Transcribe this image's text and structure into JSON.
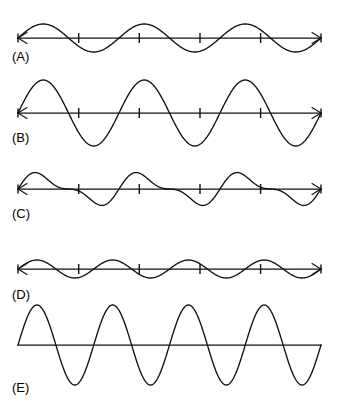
{
  "figure": {
    "title": "",
    "background_color": "#ffffff",
    "stroke_color": "#111111",
    "width": 337,
    "height": 414
  },
  "labels": [
    {
      "id": "A",
      "text": "(A)",
      "x": 12,
      "y": 50
    },
    {
      "id": "B",
      "text": "(B)",
      "x": 12,
      "y": 131
    },
    {
      "id": "C",
      "text": "(C)",
      "x": 12,
      "y": 207
    },
    {
      "id": "D",
      "text": "(D)",
      "x": 12,
      "y": 288
    },
    {
      "id": "E",
      "text": "(E)",
      "x": 12,
      "y": 381
    }
  ],
  "chart_data": {
    "type": "line",
    "xlabel": "",
    "ylabel": "",
    "grid": false,
    "legend_position": "none",
    "axis_x_start": 18,
    "axis_x_end": 321,
    "shared_tick_positions": [
      78.7,
      139.3,
      200.0,
      260.6
    ],
    "panels": [
      {
        "id": "A",
        "label": "(A)",
        "axis_y": 38,
        "x_start": 18,
        "x_end": 321,
        "amplitude_px": 14,
        "cycles": 3,
        "phase": "sine-positive-first",
        "has_arrows": true,
        "has_ticks": true,
        "tick_count": 4,
        "waveform": "sine",
        "series": [
          {
            "name": "A",
            "description": "3 full sine cycles, small amplitude",
            "amplitude": 14,
            "wavelength_px": 101,
            "values_note": "y = axis_y - 14*sin(2*pi*3*(x-18)/303)"
          }
        ]
      },
      {
        "id": "B",
        "label": "(B)",
        "axis_y": 113,
        "x_start": 18,
        "x_end": 321,
        "amplitude_px": 33,
        "cycles": 3,
        "phase": "sine-positive-first",
        "has_arrows": true,
        "has_ticks": true,
        "tick_count": 4,
        "waveform": "sine",
        "series": [
          {
            "name": "B",
            "description": "3 full sine cycles, large amplitude",
            "amplitude": 33,
            "wavelength_px": 101,
            "values_note": "y = axis_y - 33*sin(2*pi*3*(x-18)/303)"
          }
        ]
      },
      {
        "id": "C",
        "label": "(C)",
        "axis_y": 189,
        "x_start": 18,
        "x_end": 321,
        "amplitude_px": 17,
        "cycles": 3,
        "phase": "beat-superposition",
        "has_arrows": true,
        "has_ticks": true,
        "tick_count": 4,
        "waveform": "superposition",
        "series": [
          {
            "name": "C",
            "description": "Superposition of 3-cycle and 6-cycle sine waves producing a beat-like waveform",
            "amplitude": 17,
            "components": [
              {
                "cycles": 3,
                "amplitude": 13
              },
              {
                "cycles": 6,
                "amplitude": 6
              }
            ],
            "values_note": "y = axis_y - (13*sin(2*pi*3*t) + 6*sin(2*pi*6*t)), t=(x-18)/303"
          }
        ]
      },
      {
        "id": "D",
        "label": "(D)",
        "axis_y": 269,
        "x_start": 18,
        "x_end": 321,
        "amplitude_px": 9,
        "cycles": 4,
        "phase": "sine-positive-first",
        "has_arrows": true,
        "has_ticks": true,
        "tick_count": 4,
        "waveform": "sine",
        "series": [
          {
            "name": "D",
            "description": "4 full sine cycles, very small amplitude",
            "amplitude": 9,
            "wavelength_px": 76,
            "values_note": "y = axis_y - 9*sin(2*pi*4*(x-18)/303)"
          }
        ]
      },
      {
        "id": "E",
        "label": "(E)",
        "axis_y": 345,
        "x_start": 18,
        "x_end": 321,
        "amplitude_px": 40,
        "cycles": 4,
        "phase": "sine-positive-first",
        "has_arrows": false,
        "has_ticks": false,
        "tick_count": 0,
        "waveform": "sine",
        "series": [
          {
            "name": "E",
            "description": "4 full sine cycles, largest amplitude, plain axis with no arrows or ticks",
            "amplitude": 40,
            "wavelength_px": 76,
            "values_note": "y = axis_y - 40*sin(2*pi*4*(x-18)/303)"
          }
        ]
      }
    ]
  }
}
